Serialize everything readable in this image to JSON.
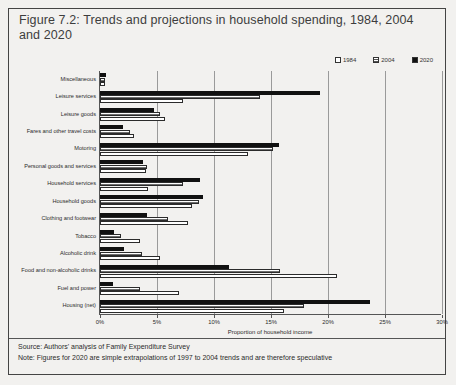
{
  "title": "Figure 7.2: Trends and projections in household spending, 1984, 2004 and 2020",
  "footer": {
    "source": "Source: Authors' analysis of Family Expenditure Survey",
    "note": "Note: Figures for 2020 are simple extrapolations of 1997 to 2004 trends and are therefore speculative"
  },
  "legend": {
    "position": "top-right",
    "entries": [
      {
        "label": "1984",
        "key": "y1984",
        "color": "#ffffff"
      },
      {
        "label": "2004",
        "key": "y2004",
        "color": "#6e6e6e"
      },
      {
        "label": "2020",
        "key": "y2020",
        "color": "#111111"
      }
    ]
  },
  "chart_data": {
    "type": "bar",
    "orientation": "horizontal",
    "title": "Figure 7.2: Trends and projections in household spending, 1984, 2004 and 2020",
    "xlabel": "Proportion of household income",
    "ylabel": "",
    "xlim": [
      0,
      30
    ],
    "xticks": [
      0,
      5,
      10,
      15,
      20,
      25,
      30
    ],
    "xticklabels": [
      "0%",
      "5%",
      "10%",
      "15%",
      "20%",
      "25%",
      "30%"
    ],
    "grid": true,
    "categories": [
      "Miscellaneous",
      "Leisure services",
      "Leisure goods",
      "Fares and other travel costs",
      "Motoring",
      "Personal goods and services",
      "Household services",
      "Household goods",
      "Clothing and footwear",
      "Tobacco",
      "Alcoholic drink",
      "Food and non-alcoholic drinks",
      "Fuel and power",
      "Housing (net)"
    ],
    "series": [
      {
        "name": "1984",
        "values": [
          0.4,
          7.3,
          5.7,
          3.0,
          13.0,
          4.0,
          4.2,
          8.1,
          7.7,
          3.5,
          5.3,
          20.8,
          6.9,
          16.1
        ]
      },
      {
        "name": "2004",
        "values": [
          0.4,
          14.0,
          5.3,
          2.6,
          15.2,
          4.1,
          7.3,
          8.7,
          6.0,
          1.8,
          3.7,
          15.8,
          3.5,
          17.9
        ]
      },
      {
        "name": "2020",
        "values": [
          0.5,
          19.3,
          4.7,
          2.0,
          15.7,
          3.8,
          8.8,
          9.0,
          4.1,
          1.2,
          2.1,
          11.3,
          1.1,
          23.7
        ]
      }
    ]
  }
}
